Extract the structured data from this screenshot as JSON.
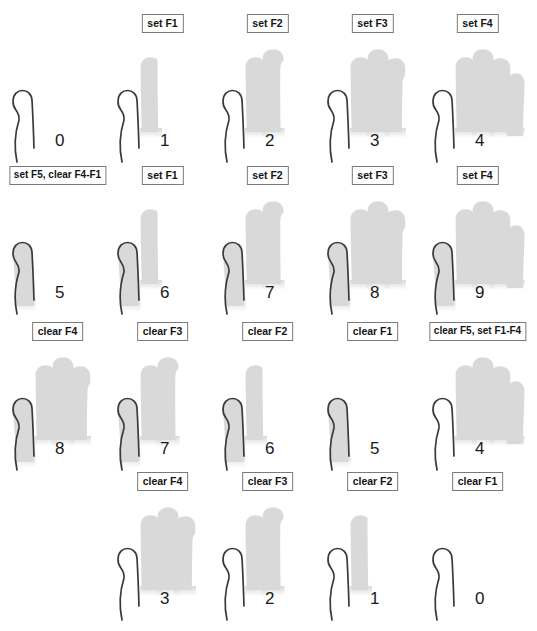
{
  "figure": {
    "title_fragment_top": "",
    "caption_fragment_bottom": "",
    "palette": {
      "outline": "#3a3a3a",
      "fill_active": "#d9d9d9",
      "fill_inactive": "#ffffff",
      "tag_border": "#7a7a7a",
      "tag_background": "#ffffff",
      "text": "#1a1a1a",
      "page_background": "#ffffff"
    },
    "finger_map": {
      "F1": "index",
      "F2": "middle",
      "F3": "ring",
      "F4": "pinky",
      "F5": "thumb"
    },
    "finger_order": [
      "thumb",
      "index",
      "middle",
      "ring",
      "pinky"
    ]
  },
  "rows": [
    {
      "row_index": 0,
      "start_col": 0,
      "cells": [
        {
          "label": "",
          "count": "0",
          "raised": []
        },
        {
          "label": "set F1",
          "count": "1",
          "raised": [
            "index"
          ]
        },
        {
          "label": "set F2",
          "count": "2",
          "raised": [
            "index",
            "middle"
          ]
        },
        {
          "label": "set F3",
          "count": "3",
          "raised": [
            "index",
            "middle",
            "ring"
          ]
        },
        {
          "label": "set F4",
          "count": "4",
          "raised": [
            "index",
            "middle",
            "ring",
            "pinky"
          ]
        }
      ]
    },
    {
      "row_index": 1,
      "start_col": 0,
      "cells": [
        {
          "label": "set F5, clear F4-F1",
          "count": "5",
          "raised": [
            "thumb"
          ]
        },
        {
          "label": "set F1",
          "count": "6",
          "raised": [
            "thumb",
            "index"
          ]
        },
        {
          "label": "set F2",
          "count": "7",
          "raised": [
            "thumb",
            "index",
            "middle"
          ]
        },
        {
          "label": "set F3",
          "count": "8",
          "raised": [
            "thumb",
            "index",
            "middle",
            "ring"
          ]
        },
        {
          "label": "set F4",
          "count": "9",
          "raised": [
            "thumb",
            "index",
            "middle",
            "ring",
            "pinky"
          ]
        }
      ]
    },
    {
      "row_index": 2,
      "start_col": 0,
      "cells": [
        {
          "label": "clear F4",
          "count": "8",
          "raised": [
            "thumb",
            "index",
            "middle",
            "ring"
          ]
        },
        {
          "label": "clear F3",
          "count": "7",
          "raised": [
            "thumb",
            "index",
            "middle"
          ]
        },
        {
          "label": "clear F2",
          "count": "6",
          "raised": [
            "thumb",
            "index"
          ]
        },
        {
          "label": "clear F1",
          "count": "5",
          "raised": [
            "thumb"
          ]
        },
        {
          "label": "clear F5, set F1-F4",
          "count": "4",
          "raised": [
            "index",
            "middle",
            "ring",
            "pinky"
          ]
        }
      ]
    },
    {
      "row_index": 3,
      "start_col": 1,
      "cells": [
        {
          "label": "clear F4",
          "count": "3",
          "raised": [
            "index",
            "middle",
            "ring"
          ]
        },
        {
          "label": "clear F3",
          "count": "2",
          "raised": [
            "index",
            "middle"
          ]
        },
        {
          "label": "clear F2",
          "count": "1",
          "raised": [
            "index"
          ]
        },
        {
          "label": "clear F1",
          "count": "0",
          "raised": []
        }
      ]
    }
  ]
}
